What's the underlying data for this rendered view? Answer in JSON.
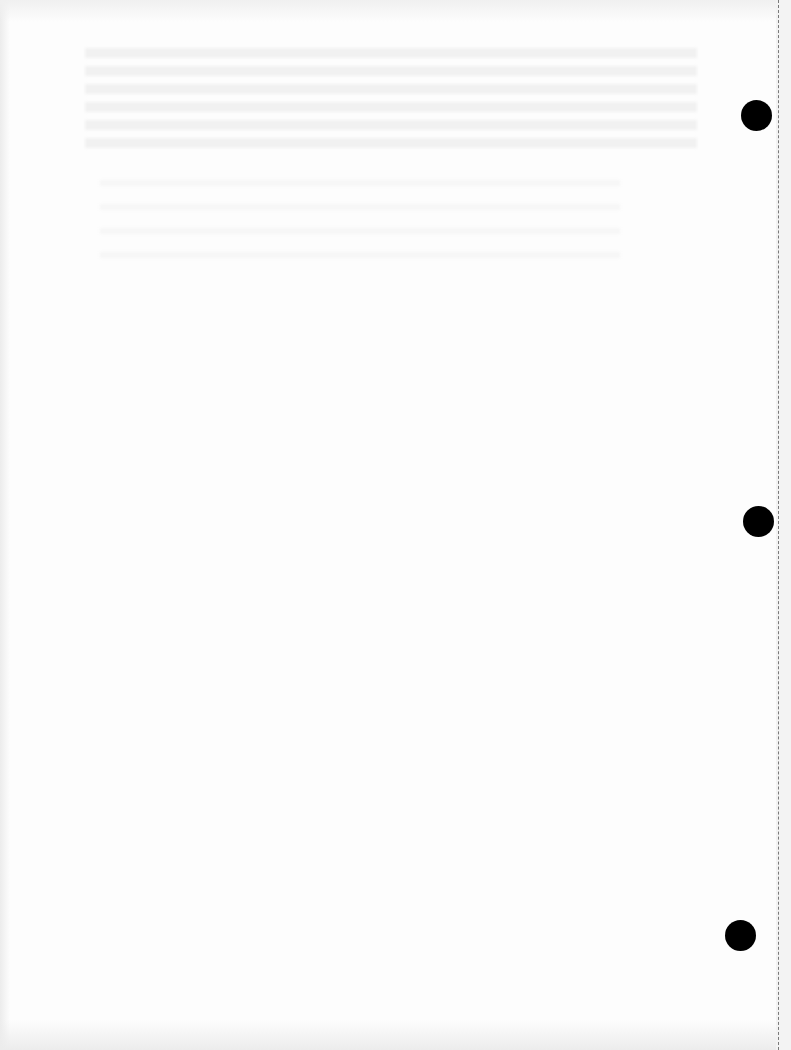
{
  "document": {
    "type": "scanned blank page",
    "background_color": "#fdfdfd",
    "punch_holes": [
      {
        "x": 756,
        "y": 115,
        "diameter": 31
      },
      {
        "x": 758,
        "y": 521,
        "diameter": 31
      },
      {
        "x": 740,
        "y": 935,
        "diameter": 31
      }
    ],
    "punch_hole_color": "#000000",
    "perforation": {
      "side": "right",
      "style": "dashed",
      "color": "#7a7a7a"
    },
    "visible_text": []
  }
}
